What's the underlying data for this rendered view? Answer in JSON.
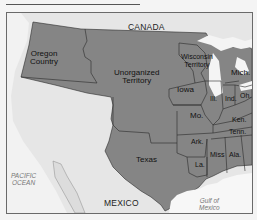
{
  "map": {
    "title_rule": true,
    "colors": {
      "territory_fill": "#858585",
      "land_other": "#e6e6e6",
      "water": "#f7f7f7",
      "border": "#2a2a2a",
      "frame": "#6a6a6a"
    },
    "countries": {
      "north": "CANADA",
      "south": "MEXICO"
    },
    "water_bodies": {
      "pacific_line1": "PACIFIC",
      "pacific_line2": "OCEAN",
      "gulf_line1": "Gulf of",
      "gulf_line2": "Mexico"
    },
    "regions": {
      "oregon_line1": "Oregon",
      "oregon_line2": "Country",
      "unorganized_line1": "Unorganized",
      "unorganized_line2": "Territory",
      "wisconsin_line1": "Wisconsin",
      "wisconsin_line2": "Territory",
      "texas": "Texas"
    },
    "states": {
      "iowa": "Iowa",
      "illinois": "Ill.",
      "indiana": "Ind.",
      "ohio": "Oh.",
      "michigan": "Mich.",
      "missouri": "Mo.",
      "kentucky": "Ken.",
      "tennessee": "Tenn.",
      "arkansas": "Ark.",
      "mississippi": "Miss",
      "alabama": "Ala.",
      "louisiana": "La."
    }
  }
}
